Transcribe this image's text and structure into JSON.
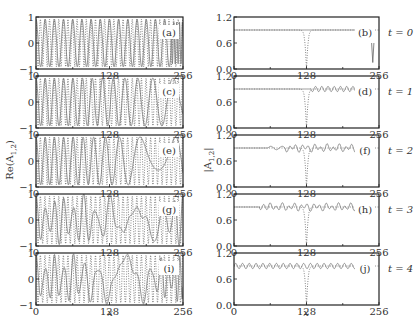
{
  "figure": {
    "left_ylabel": "Re(A",
    "left_ylabel_sub": "1,2",
    "left_ylabel_close": ")",
    "right_ylabel": "|A",
    "right_ylabel_sub": "1,2",
    "right_ylabel_close": "|",
    "xlabel": "x",
    "time_labels": [
      "t = 0",
      "t = 1",
      "t = 2",
      "t = 3",
      "t = 4"
    ]
  },
  "chart_data": [
    {
      "type": "line",
      "column": "left",
      "panels": [
        "(a)",
        "(c)",
        "(e)",
        "(g)",
        "(i)"
      ],
      "times": [
        0,
        1,
        2,
        3,
        4
      ],
      "ylabel": "Re(A_{1,2})",
      "xlabel": "x",
      "xlim": [
        0,
        256
      ],
      "ylim": [
        -1,
        1
      ],
      "xticks": [
        0,
        128,
        256
      ],
      "yticks": [
        -1,
        0,
        1
      ],
      "series": [
        {
          "name": "Re(A1)",
          "style": "solid",
          "description": "oscillating carrier, wavelength ~16 at t=0, becoming irregular/longer-wavelength with time on right half"
        },
        {
          "name": "Re(A2)",
          "style": "dotted",
          "description": "fast oscillation, wavelength ~8"
        }
      ]
    },
    {
      "type": "line",
      "column": "right",
      "panels": [
        "(b)",
        "(d)",
        "(f)",
        "(h)",
        "(j)"
      ],
      "times": [
        0,
        1,
        2,
        3,
        4
      ],
      "ylabel": "|A_{1,2}|",
      "xlabel": "x",
      "xlim": [
        0,
        256
      ],
      "ylim": [
        0.0,
        1.2
      ],
      "xticks": [
        0,
        128,
        256
      ],
      "yticks": [
        0.0,
        0.6,
        1.2
      ],
      "series": [
        {
          "name": "|A1|",
          "style": "solid",
          "baseline": 0.9,
          "description": "flat ~0.9 with small dip at x~245 at t=0; ripples of amplitude ~0.05 spreading from right to whole domain by t=4"
        },
        {
          "name": "|A2|",
          "style": "dotted",
          "baseline": 0.9,
          "description": "flat ~0.9 with dark-soliton dip to ~0 at x=128 at all times"
        }
      ]
    }
  ]
}
